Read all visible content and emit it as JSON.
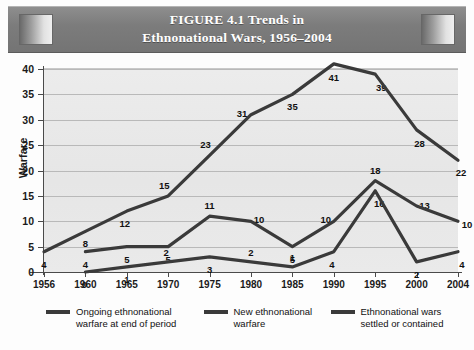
{
  "figure": {
    "title_line_1": "FIGURE 4.1    Trends in",
    "title_line_2": "Ethnonational Wars, 1956–2004",
    "banner_color": "#7c7c7c",
    "plot_background": "#e9e9e9",
    "line_color": "#3a3a3a"
  },
  "chart_data": {
    "type": "line",
    "title": "FIGURE 4.1 Trends in Ethnonational Wars, 1956–2004",
    "xlabel": "",
    "ylabel": "Warfare",
    "x": [
      1956,
      1960,
      1965,
      1970,
      1975,
      1980,
      1985,
      1990,
      1995,
      2000,
      2004
    ],
    "xtick_labels": [
      "1956",
      "1960",
      "1965",
      "1970",
      "1975",
      "1980",
      "1985",
      "1990",
      "1995",
      "2000",
      "2004"
    ],
    "ytick_labels": [
      "0",
      "5",
      "10",
      "15",
      "20",
      "25",
      "30",
      "35",
      "40"
    ],
    "yticks": [
      0,
      5,
      10,
      15,
      20,
      25,
      30,
      35,
      40
    ],
    "ylim": [
      0,
      40
    ],
    "grid": true,
    "legend_position": "bottom",
    "series": [
      {
        "name": "Ongoing ethnonational warfare at end of period",
        "color": "#3a3a3a",
        "x": [
          1956,
          1960,
          1965,
          1970,
          1975,
          1980,
          1985,
          1990,
          1995,
          2000,
          2004
        ],
        "values": [
          4,
          8,
          12,
          15,
          23,
          31,
          35,
          41,
          39,
          28,
          22
        ]
      },
      {
        "name": "New ethnonational warfare",
        "color": "#3a3a3a",
        "x": [
          1960,
          1965,
          1970,
          1975,
          1980,
          1985,
          1990,
          1995,
          2000,
          2004
        ],
        "values": [
          4,
          5,
          5,
          11,
          10,
          5,
          10,
          18,
          13,
          10
        ]
      },
      {
        "name": "Ethnonational wars settled or contained",
        "color": "#3a3a3a",
        "x": [
          1960,
          1965,
          1970,
          1975,
          1980,
          1985,
          1990,
          1995,
          2000,
          2004
        ],
        "values": [
          0,
          1,
          2,
          3,
          2,
          1,
          4,
          16,
          2,
          4
        ]
      }
    ]
  },
  "legend": {
    "items": [
      {
        "line_1": "Ongoing ethnonational",
        "line_2": "warfare at end of period"
      },
      {
        "line_1": "New ethnonational",
        "line_2": "warfare",
        "line_2_blank": ""
      },
      {
        "line_1": "Ethnonational wars",
        "line_2": "settled or contained"
      }
    ]
  }
}
